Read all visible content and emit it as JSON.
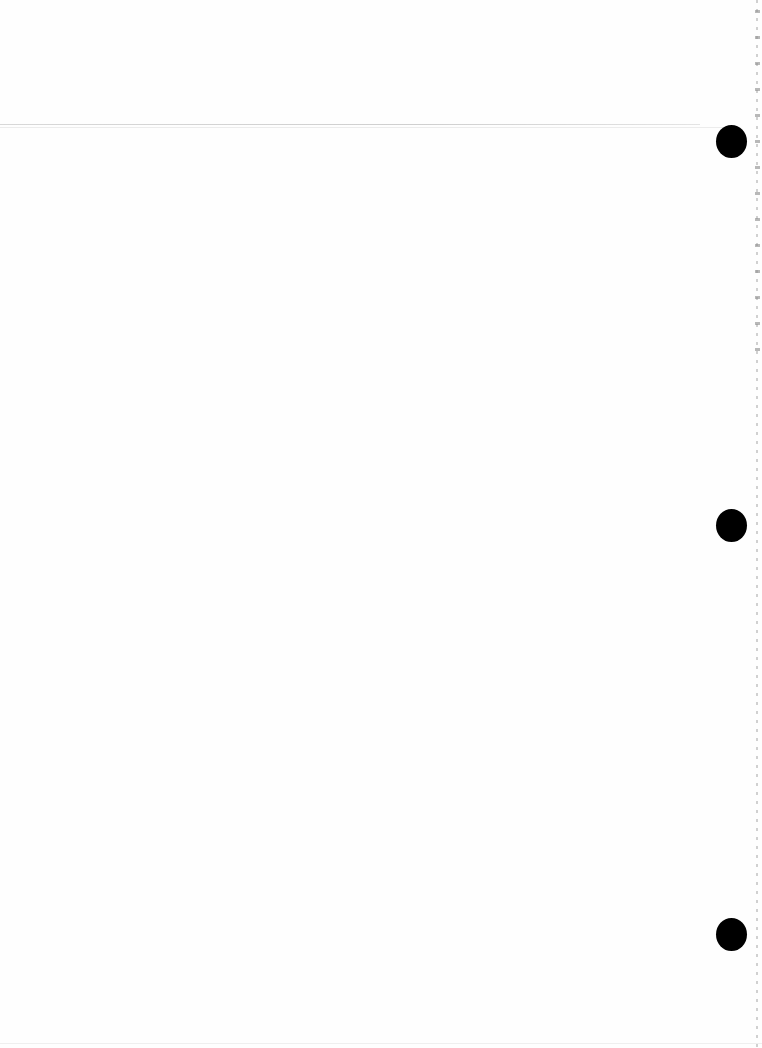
{
  "document": {
    "type": "blank-scanned-page",
    "text_content": [],
    "punch_holes": [
      {
        "cx": 731,
        "cy": 141
      },
      {
        "cx": 731,
        "cy": 525
      },
      {
        "cx": 731,
        "cy": 934
      }
    ],
    "colors": {
      "paper": "#fefefe",
      "hole": "#000000",
      "rule": "#d4d4d4"
    }
  }
}
